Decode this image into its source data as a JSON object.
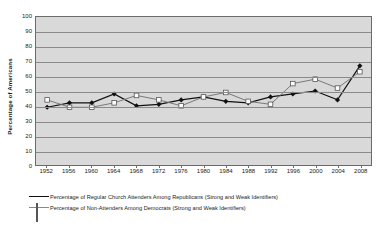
{
  "chart_data": {
    "type": "line",
    "title": "",
    "xlabel": "",
    "ylabel": "Percentage of Americans",
    "ylim": [
      0,
      100
    ],
    "ytick_step": 10,
    "grid": true,
    "legend_position": "bottom-left",
    "categories": [
      "1952",
      "1956",
      "1960",
      "1964",
      "1968",
      "1972",
      "1976",
      "1980",
      "1984",
      "1988",
      "1992",
      "1996",
      "2000",
      "2004",
      "2008"
    ],
    "yticks": [
      "0",
      "10",
      "20",
      "30",
      "40",
      "50",
      "60",
      "70",
      "80",
      "90",
      "100"
    ],
    "series": [
      {
        "name": "Percentage of Regular Church Attenders Among Republicans (Strong and Weak Identifiers)",
        "marker": "filled-diamond",
        "color": "#111111",
        "values": [
          39,
          42,
          42,
          48,
          40,
          41,
          44,
          46,
          43,
          42,
          46,
          48,
          50,
          44,
          67
        ]
      },
      {
        "name": "Percentage of Non-Attenders Among Democrats (Strong and Weak Identifiers)",
        "marker": "open-square",
        "color": "#777777",
        "values": [
          44,
          39,
          39,
          42,
          47,
          44,
          40,
          46,
          49,
          43,
          41,
          55,
          58,
          52,
          63
        ]
      }
    ]
  },
  "legend": {
    "items": [
      {
        "label": "Percentage of Regular Church Attenders Among Republicans (Strong and Weak Identifiers)",
        "marker": "filled-diamond"
      },
      {
        "label": "Percentage of Non-Attenders Among Democrats (Strong and Weak Identifiers)",
        "marker": "open-square"
      }
    ]
  },
  "colors": {
    "plot_background": "#d9d9d9",
    "gridline": "#8a8a8a",
    "series_1": "#111111",
    "series_2": "#777777",
    "axis": "#6b6b6b"
  }
}
